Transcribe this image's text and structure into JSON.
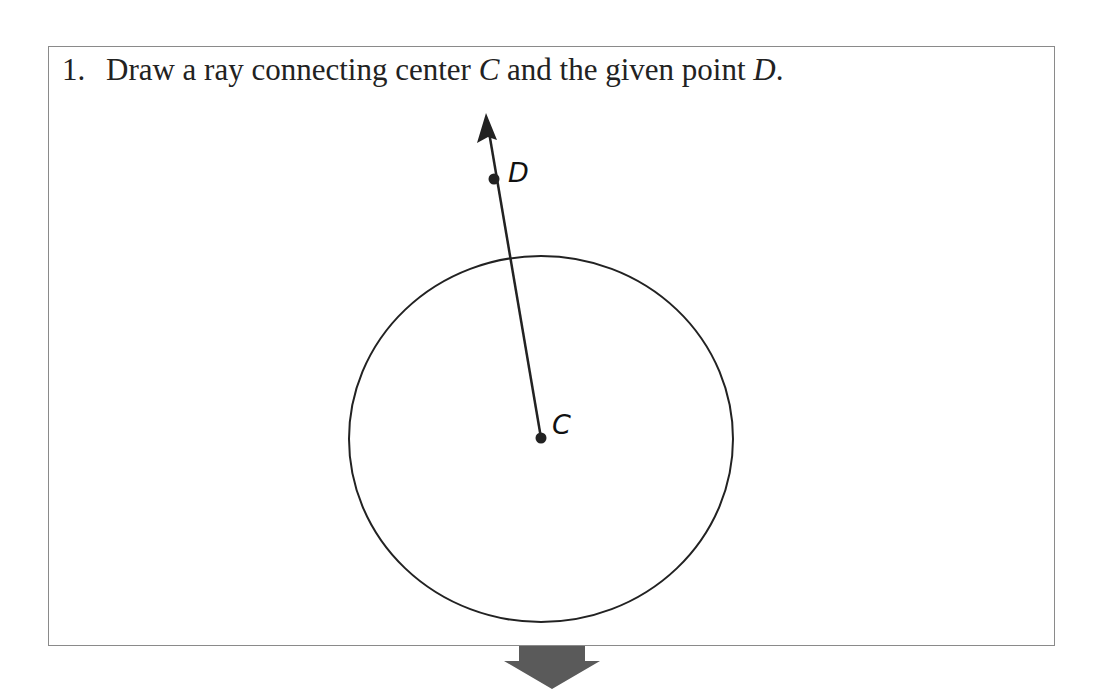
{
  "instruction": {
    "number": "1.",
    "text_before": "Draw a ray connecting center ",
    "center_label": "C",
    "text_middle": " and the given point ",
    "point_label": "D",
    "text_end": "."
  },
  "figure": {
    "circle": {
      "cx": 541,
      "cy": 439,
      "rx": 192,
      "ry": 183,
      "stroke": "#222222"
    },
    "center_point": {
      "label": "C",
      "x": 541,
      "y": 438
    },
    "given_point": {
      "label": "D",
      "x": 494,
      "y": 179
    },
    "ray": {
      "from": "C",
      "through": "D",
      "arrow_tip": [
        486,
        113
      ]
    }
  },
  "continue_arrow": {
    "color": "#5a5a5a",
    "direction": "down"
  }
}
